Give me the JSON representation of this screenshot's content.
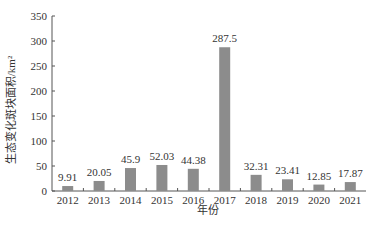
{
  "chart_data": {
    "type": "bar",
    "title": "",
    "xlabel": "年份",
    "ylabel": "生态变化斑块面积/km²",
    "categories": [
      "2012",
      "2013",
      "2014",
      "2015",
      "2016",
      "2017",
      "2018",
      "2019",
      "2020",
      "2021"
    ],
    "values": [
      9.91,
      20.05,
      45.9,
      52.03,
      44.38,
      287.5,
      32.31,
      23.41,
      12.85,
      17.87
    ],
    "value_labels": [
      "9.91",
      "20.05",
      "45.9",
      "52.03",
      "44.38",
      "287.5",
      "32.31",
      "23.41",
      "12.85",
      "17.87"
    ],
    "ylim": [
      0,
      350
    ],
    "yticks": [
      0,
      50,
      100,
      150,
      200,
      250,
      300,
      350
    ],
    "grid": false,
    "legend": null,
    "bar_color": "#8c8c8c"
  }
}
